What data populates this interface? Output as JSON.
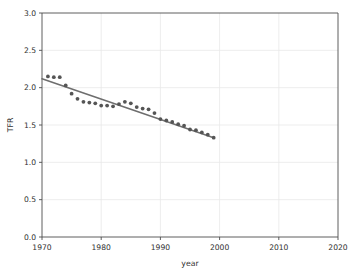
{
  "chart_data": {
    "type": "scatter",
    "title": "",
    "xlabel": "year",
    "ylabel": "TFR",
    "xlim": [
      1970,
      2020
    ],
    "ylim": [
      0.0,
      3.0
    ],
    "xticks": [
      1970,
      1980,
      1990,
      2000,
      2010,
      2020
    ],
    "xtick_labels": [
      "1970",
      "1980",
      "1990",
      "2000",
      "2010",
      "2020"
    ],
    "yticks": [
      0.0,
      0.5,
      1.0,
      1.5,
      2.0,
      2.5,
      3.0
    ],
    "ytick_labels": [
      "0.0",
      "0.5",
      "1.0",
      "1.5",
      "2.0",
      "2.5",
      "3.0"
    ],
    "grid": true,
    "legend": "none",
    "marker_color": "#555555",
    "line_color": "#6e6e6e",
    "grid_color": "#e8e8e8",
    "axis_color": "#4d4d4d",
    "series": [
      {
        "name": "TFR observations",
        "type": "scatter",
        "x": [
          1971,
          1972,
          1973,
          1974,
          1975,
          1976,
          1977,
          1978,
          1979,
          1980,
          1981,
          1982,
          1983,
          1984,
          1985,
          1986,
          1987,
          1988,
          1989,
          1990,
          1991,
          1992,
          1993,
          1994,
          1995,
          1996,
          1997,
          1998,
          1999
        ],
        "y": [
          2.15,
          2.14,
          2.14,
          2.03,
          1.92,
          1.85,
          1.81,
          1.8,
          1.79,
          1.76,
          1.76,
          1.75,
          1.78,
          1.81,
          1.79,
          1.74,
          1.72,
          1.71,
          1.66,
          1.58,
          1.56,
          1.54,
          1.51,
          1.49,
          1.44,
          1.43,
          1.4,
          1.37,
          1.33
        ]
      },
      {
        "name": "linear fit",
        "type": "line",
        "x": [
          1970,
          1999
        ],
        "y": [
          2.12,
          1.33
        ]
      }
    ]
  },
  "figure": {
    "background_color": "#ffffff"
  }
}
